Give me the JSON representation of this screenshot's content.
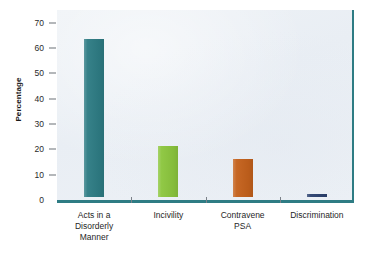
{
  "chart_data": {
    "type": "bar",
    "title": "",
    "subtitle": "",
    "xlabel": "",
    "ylabel": "Percentage",
    "ylim": [
      0,
      75
    ],
    "ytick_labels": [
      "0",
      "10",
      "20",
      "30",
      "40",
      "50",
      "60",
      "70"
    ],
    "ytick_values": [
      0,
      10,
      20,
      30,
      40,
      50,
      60,
      70
    ],
    "grid": false,
    "legend": "none",
    "categories": [
      "Acts in a Disorderly Manner",
      "Incivility",
      "Contravene PSA",
      "Discrimination"
    ],
    "category_lines": [
      [
        "Acts in a",
        "Disorderly",
        "Manner"
      ],
      [
        "Incivility"
      ],
      [
        "Contravene",
        "PSA"
      ],
      [
        "Discrimination"
      ]
    ],
    "values": [
      62.5,
      20,
      15,
      1
    ],
    "bar_colors": [
      "#2E7C84",
      "#8CC63E",
      "#C4611C",
      "#2C4270"
    ],
    "series": [
      {
        "name": "Percentage",
        "values": [
          62.5,
          20,
          15,
          1
        ]
      }
    ]
  },
  "style": {
    "plot_background": "#EDF1F5",
    "axis_accent": "#2E7C84",
    "page_background": "#FFFFFF",
    "tick_color": "#6B7076",
    "text_color": "#1F1F1F"
  }
}
